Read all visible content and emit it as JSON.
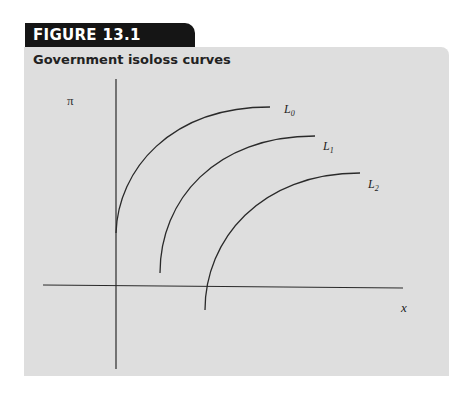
{
  "figure": {
    "label": "FIGURE 13.1",
    "title": "Government isoloss curves"
  },
  "axes": {
    "y_label": "π",
    "x_label": "x"
  },
  "colors": {
    "tab_bg": "#151515",
    "panel_bg": "#dedede",
    "line": "#2a2a2a"
  },
  "curves": [
    {
      "name": "L",
      "sub": "0"
    },
    {
      "name": "L",
      "sub": "1"
    },
    {
      "name": "L",
      "sub": "2"
    }
  ]
}
